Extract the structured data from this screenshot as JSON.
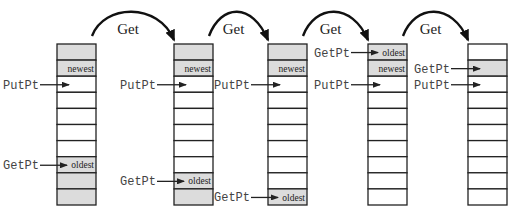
{
  "diagram": {
    "colors": {
      "filled_cell": "#dcdcdc",
      "empty_cell": "#ffffff",
      "border": "#222222",
      "pointer_text": "#444444",
      "arrow": "#111111"
    },
    "transition_label": "Get",
    "buffers": [
      {
        "name": "state-1",
        "cells": 10,
        "filled": [
          0,
          1,
          7,
          8,
          9
        ],
        "labels": [
          {
            "cell": 1,
            "text": "newest"
          },
          {
            "cell": 7,
            "text": "oldest"
          }
        ],
        "pointers": [
          {
            "name": "PutPt",
            "cell": 2
          },
          {
            "name": "GetPt",
            "cell": 7
          }
        ]
      },
      {
        "name": "state-2",
        "cells": 10,
        "filled": [
          0,
          1,
          8,
          9
        ],
        "labels": [
          {
            "cell": 1,
            "text": "newest"
          },
          {
            "cell": 8,
            "text": "oldest"
          }
        ],
        "pointers": [
          {
            "name": "PutPt",
            "cell": 2
          },
          {
            "name": "GetPt",
            "cell": 8
          }
        ]
      },
      {
        "name": "state-3",
        "cells": 10,
        "filled": [
          0,
          1,
          9
        ],
        "labels": [
          {
            "cell": 1,
            "text": "newest"
          },
          {
            "cell": 9,
            "text": "oldest"
          }
        ],
        "pointers": [
          {
            "name": "PutPt",
            "cell": 2
          },
          {
            "name": "GetPt",
            "cell": 9
          }
        ]
      },
      {
        "name": "state-4",
        "cells": 10,
        "filled": [
          0,
          1
        ],
        "labels": [
          {
            "cell": 0,
            "text": "oldest"
          },
          {
            "cell": 1,
            "text": "newest"
          }
        ],
        "pointers": [
          {
            "name": "GetPt",
            "cell": 0
          },
          {
            "name": "PutPt",
            "cell": 2
          }
        ]
      },
      {
        "name": "state-5",
        "cells": 10,
        "filled": [
          1
        ],
        "labels": [],
        "pointers": [
          {
            "name": "GetPt",
            "cell": 1
          },
          {
            "name": "PutPt",
            "cell": 2
          }
        ]
      }
    ],
    "transitions": [
      {
        "from": 0,
        "to": 1,
        "label": "Get"
      },
      {
        "from": 1,
        "to": 2,
        "label": "Get"
      },
      {
        "from": 2,
        "to": 3,
        "label": "Get"
      },
      {
        "from": 3,
        "to": 4,
        "label": "Get"
      }
    ]
  }
}
